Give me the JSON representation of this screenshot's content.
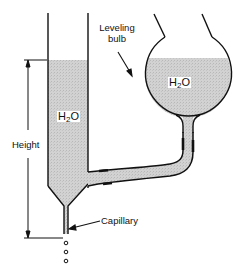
{
  "diagram": {
    "labels": {
      "leveling_bulb_line1": "Leveling",
      "leveling_bulb_line2": "bulb",
      "h2o_tube_main": "H",
      "h2o_tube_sub": "2",
      "h2o_tube_end": "O",
      "h2o_bulb_main": "H",
      "h2o_bulb_sub": "2",
      "h2o_bulb_end": "O",
      "height": "Height",
      "capillary": "Capillary"
    },
    "colors": {
      "water_fill": "#cfcfcf",
      "outline": "#111111",
      "background": "#ffffff"
    },
    "drops_count": 3
  }
}
